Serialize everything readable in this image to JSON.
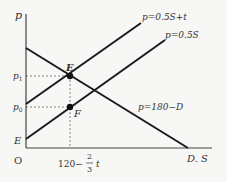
{
  "diagram": {
    "type": "supply-demand",
    "axes": {
      "y_label": "p",
      "x_label": "D. S",
      "origin_label": "O"
    },
    "lines": [
      {
        "id": "supply-tax",
        "label": "p=0.5S+t"
      },
      {
        "id": "supply",
        "label": "p=0.5S"
      },
      {
        "id": "demand",
        "label": "p=180−D"
      }
    ],
    "points": [
      {
        "id": "E-equilibrium",
        "label": "E"
      },
      {
        "id": "F",
        "label": "F"
      }
    ],
    "y_ticks": {
      "p1": "p",
      "p1_sub": "1",
      "p0": "p",
      "p0_sub": "0",
      "intercept": "E"
    },
    "x_tick": {
      "prefix": "120−",
      "frac_num": "2",
      "frac_den": "3",
      "suffix": "t"
    },
    "colors": {
      "line": "#1a1a1a",
      "axis": "#333333",
      "dashed": "#555555",
      "background": "#f7f7f5"
    }
  }
}
